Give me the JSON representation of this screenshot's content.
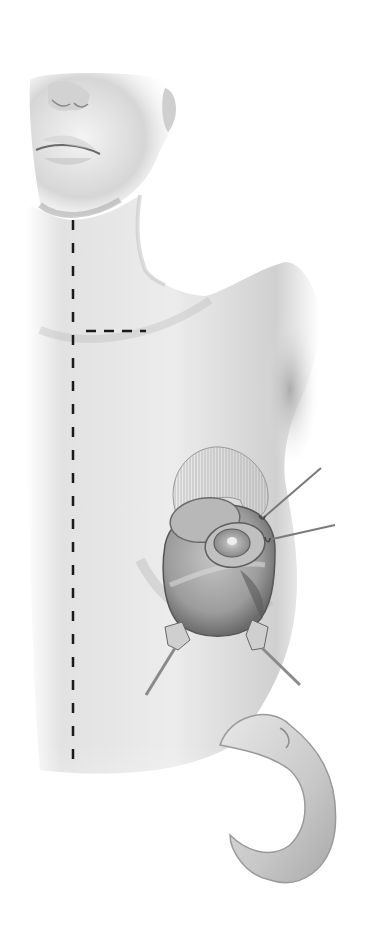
{
  "illustration": {
    "subject": "surgical-illustration-breast-procedure",
    "style": "grayscale pencil shading",
    "colors": {
      "background": "#ffffff",
      "skin_light": "#eeeeee",
      "skin_mid": "#cfcfcf",
      "skin_dark": "#9a9a9a",
      "tissue": "#a8a8a8",
      "tissue_dark": "#6e6e6e",
      "dash_line": "#1a1a1a",
      "instrument": "#8a8a8a"
    },
    "elements": [
      {
        "name": "face-lower",
        "description": "nose, lips, chin, ear"
      },
      {
        "name": "neck-shoulder",
        "description": "neck and right shoulder contour"
      },
      {
        "name": "midline-dashed-line",
        "description": "vertical dashed line from chin to lower torso"
      },
      {
        "name": "clavicle-dashed-line",
        "description": "short horizontal dashed line at sternal notch"
      },
      {
        "name": "hatched-flap",
        "description": "semicircular hatched region above incision"
      },
      {
        "name": "surgical-incision",
        "description": "open circular incision exposing tissue"
      },
      {
        "name": "areola-flap",
        "description": "nipple-areola complex retracted"
      },
      {
        "name": "skin-hooks",
        "description": "two fine hooks retracting to upper right"
      },
      {
        "name": "retractors",
        "description": "two rake retractors at lower edge"
      },
      {
        "name": "resected-tissue-specimen",
        "description": "crescent-shaped tissue specimen"
      }
    ]
  }
}
